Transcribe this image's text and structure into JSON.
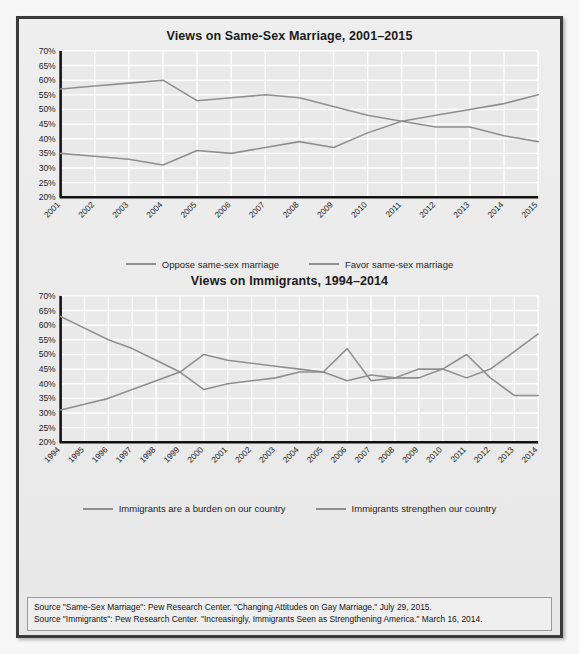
{
  "figure": {
    "source_lines": [
      "Source \"Same-Sex Marriage\": Pew Research Center. \"Changing Attitudes on Gay Marriage.\" July 29, 2015.",
      "Source \"Immigrants\": Pew Research Center. \"Increasingly, Immigrants Seen as Strengthening America.\" March 16, 2014."
    ]
  },
  "colors": {
    "line": "#8f8f8f",
    "axis": "#111111",
    "grid": "#ffffff",
    "plot_background": "#e9e9e9",
    "panel_background": "#ececec",
    "frame_border": "#3b3b3b",
    "text": "#1b1b1b"
  },
  "chart_data": [
    {
      "type": "line",
      "title": "Views on Same-Sex Marriage, 2001–2015",
      "xlabel": "",
      "ylabel": "",
      "ylim": [
        20,
        70
      ],
      "ytick_step": 5,
      "ytick_labels": [
        "70%",
        "65%",
        "60%",
        "55%",
        "50%",
        "45%",
        "40%",
        "35%",
        "30%",
        "25%",
        "20%"
      ],
      "grid": true,
      "legend_position": "bottom",
      "categories": [
        "2001",
        "2002",
        "2003",
        "2004",
        "2005",
        "2006",
        "2007",
        "2008",
        "2009",
        "2010",
        "2011",
        "2012",
        "2013",
        "2014",
        "2015"
      ],
      "series": [
        {
          "name": "Oppose same-sex marriage",
          "values": [
            57,
            58,
            59,
            60,
            53,
            54,
            55,
            54,
            51,
            48,
            46,
            44,
            44,
            41,
            39
          ]
        },
        {
          "name": "Favor same-sex marriage",
          "values": [
            35,
            34,
            33,
            31,
            36,
            35,
            37,
            39,
            37,
            42,
            46,
            48,
            50,
            52,
            55
          ]
        }
      ]
    },
    {
      "type": "line",
      "title": "Views on Immigrants, 1994–2014",
      "xlabel": "",
      "ylabel": "",
      "ylim": [
        20,
        70
      ],
      "ytick_step": 5,
      "ytick_labels": [
        "70%",
        "65%",
        "60%",
        "55%",
        "50%",
        "45%",
        "40%",
        "35%",
        "30%",
        "25%",
        "20%"
      ],
      "grid": true,
      "legend_position": "bottom",
      "categories": [
        "1994",
        "1995",
        "1996",
        "1997",
        "1998",
        "1999",
        "2000",
        "2001",
        "2002",
        "2003",
        "2004",
        "2005",
        "2006",
        "2007",
        "2008",
        "2009",
        "2010",
        "2011",
        "2012",
        "2013",
        "2014"
      ],
      "series": [
        {
          "name": "Immigrants are a burden on our country",
          "values": [
            63,
            59,
            55,
            52,
            48,
            44,
            50,
            48,
            47,
            46,
            45,
            44,
            52,
            41,
            42,
            45,
            45,
            50,
            42,
            36,
            36
          ]
        },
        {
          "name": "Immigrants strengthen our country",
          "values": [
            31,
            33,
            35,
            38,
            41,
            44,
            38,
            40,
            41,
            42,
            44,
            44,
            41,
            43,
            42,
            42,
            45,
            42,
            45,
            51,
            57
          ]
        }
      ]
    }
  ]
}
